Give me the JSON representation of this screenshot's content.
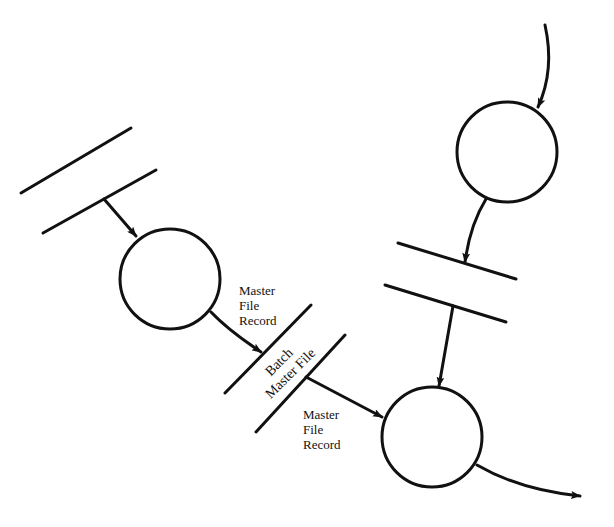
{
  "diagram": {
    "type": "data-flow-diagram",
    "colors": {
      "line": "#111111",
      "background": "#ffffff"
    },
    "processes": [
      {
        "id": "process-left",
        "cx": 170,
        "cy": 279,
        "r": 50,
        "label": ""
      },
      {
        "id": "process-top-right",
        "cx": 507,
        "cy": 152,
        "r": 50,
        "label": ""
      },
      {
        "id": "process-bottom",
        "cx": 432,
        "cy": 437,
        "r": 50,
        "label": ""
      }
    ],
    "data_stores": [
      {
        "id": "store-top-left",
        "label": ""
      },
      {
        "id": "store-batch-master-file",
        "label_lines": [
          "Batch",
          "Master File"
        ]
      },
      {
        "id": "store-right",
        "label": ""
      }
    ],
    "flows": [
      {
        "id": "flow-store-top-left-to-process-left",
        "label_lines": []
      },
      {
        "id": "flow-process-left-to-batch",
        "label_lines": [
          "Master",
          "File",
          "Record"
        ]
      },
      {
        "id": "flow-batch-to-process-bottom",
        "label_lines": [
          "Master",
          "File",
          "Record"
        ]
      },
      {
        "id": "flow-external-in-to-process-top-right",
        "label_lines": []
      },
      {
        "id": "flow-process-top-right-to-store-right",
        "label_lines": []
      },
      {
        "id": "flow-store-right-to-process-bottom",
        "label_lines": []
      },
      {
        "id": "flow-process-bottom-out",
        "label_lines": []
      }
    ]
  }
}
